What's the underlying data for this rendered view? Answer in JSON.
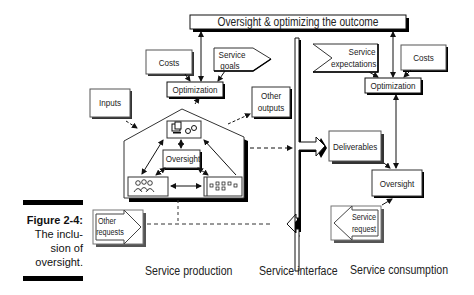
{
  "figure": {
    "number": "Figure 2-4:",
    "caption_lines": [
      "The inclu-",
      "sion of",
      "oversight."
    ]
  },
  "banner": {
    "label": "Oversight & optimizing the outcome"
  },
  "production": {
    "costs": "Costs",
    "service_goals": [
      "Service",
      "goals"
    ],
    "optimization": "Optimization",
    "inputs": "Inputs",
    "other_outputs": [
      "Other",
      "outputs"
    ],
    "oversight": "Oversight",
    "other_requests": [
      "Other",
      "requests"
    ],
    "icons": {
      "top": "computer-and-gears-icon",
      "left": "people-group-icon",
      "right": "process-flow-icon"
    }
  },
  "consumption": {
    "service_expectations": [
      "Service",
      "expectations"
    ],
    "costs": "Costs",
    "optimization": "Optimization",
    "deliverables": "Deliverables",
    "oversight": "Oversight",
    "service_request": [
      "Service",
      "request"
    ]
  },
  "sections": {
    "production": "Service production",
    "interface": "Service interface",
    "consumption": "Service consumption"
  }
}
